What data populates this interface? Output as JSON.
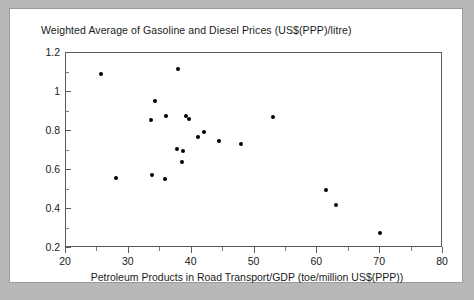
{
  "chart_data": {
    "type": "scatter",
    "title": "Weighted Average of Gasoline and Diesel Prices (US$(PPP)/litre)",
    "xlabel": "Petroleum Products in Road Transport/GDP (toe/million US$(PPP))",
    "ylabel": "Weighted Average of Gasoline and Diesel Prices (US$(PPP)/litre)",
    "xlim": [
      20,
      80
    ],
    "ylim": [
      0.2,
      1.2
    ],
    "xticks": [
      20,
      30,
      40,
      50,
      60,
      70,
      80
    ],
    "xtick_labels": [
      "20",
      "30",
      "40",
      "50",
      "60",
      "70",
      "80"
    ],
    "yticks": [
      0.2,
      0.4,
      0.6,
      0.8,
      1.0,
      1.2
    ],
    "ytick_labels": [
      "0.2",
      "0.4",
      "0.6",
      "0.8",
      "1",
      "1.2"
    ],
    "x_minor_interval": 5,
    "y_minor_interval": 0.1,
    "grid": false,
    "legend": false,
    "marker": "filled-circle",
    "marker_color": "#000000",
    "points": [
      {
        "x": 25.6,
        "y": 1.09
      },
      {
        "x": 27.9,
        "y": 0.56
      },
      {
        "x": 33.5,
        "y": 0.855
      },
      {
        "x": 34.1,
        "y": 0.955
      },
      {
        "x": 33.7,
        "y": 0.575
      },
      {
        "x": 35.7,
        "y": 0.555
      },
      {
        "x": 35.9,
        "y": 0.875
      },
      {
        "x": 37.8,
        "y": 1.12
      },
      {
        "x": 37.6,
        "y": 0.71
      },
      {
        "x": 38.7,
        "y": 0.695
      },
      {
        "x": 38.4,
        "y": 0.64
      },
      {
        "x": 39.1,
        "y": 0.875
      },
      {
        "x": 39.6,
        "y": 0.86
      },
      {
        "x": 41.0,
        "y": 0.77
      },
      {
        "x": 41.9,
        "y": 0.795
      },
      {
        "x": 44.3,
        "y": 0.75
      },
      {
        "x": 47.9,
        "y": 0.735
      },
      {
        "x": 53.0,
        "y": 0.87
      },
      {
        "x": 61.4,
        "y": 0.5
      },
      {
        "x": 63.0,
        "y": 0.42
      },
      {
        "x": 70.0,
        "y": 0.275
      }
    ]
  },
  "figure": {
    "background_color": "#b8b8b8",
    "panel_color": "#ffffff",
    "axis_color": "#5a5a5a"
  }
}
